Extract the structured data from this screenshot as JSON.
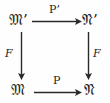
{
  "diagram": {
    "kind": "commutative-square",
    "background_color": "#fefefe",
    "ink_color": "#2a2a2a",
    "nodes": {
      "top_left": "𝔐’",
      "top_right": "𝔑’",
      "bottom_left": "𝔐",
      "bottom_right": "𝔑"
    },
    "arrows": {
      "top": {
        "label": "P’",
        "direction": "right",
        "from": "top_left",
        "to": "top_right"
      },
      "bottom": {
        "label": "P",
        "direction": "right",
        "from": "bottom_left",
        "to": "bottom_right"
      },
      "left": {
        "label": "F",
        "direction": "down",
        "from": "top_left",
        "to": "bottom_left"
      },
      "right": {
        "label": "F",
        "direction": "down",
        "from": "top_right",
        "to": "bottom_right"
      }
    }
  }
}
